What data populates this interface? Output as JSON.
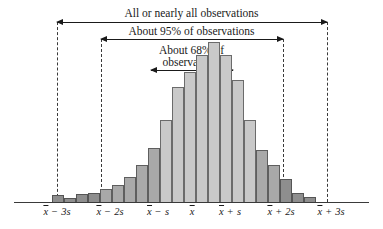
{
  "annotations": {
    "all": "All or nearly all observations",
    "pct95": "About 95% of observations",
    "pct68_line1": "About 68% of",
    "pct68_line2": "observations"
  },
  "axis": {
    "ticks": [
      {
        "id": "minus-3s",
        "mean": "x",
        "op": "−",
        "sd": "3s",
        "x": 57
      },
      {
        "id": "minus-2s",
        "mean": "x",
        "op": "−",
        "sd": "2s",
        "x": 110
      },
      {
        "id": "minus-1s",
        "mean": "x",
        "op": "−",
        "sd": "s",
        "x": 158
      },
      {
        "id": "mean",
        "mean": "x",
        "op": "",
        "sd": "",
        "x": 192
      },
      {
        "id": "plus-1s",
        "mean": "x",
        "op": "+",
        "sd": "s",
        "x": 230
      },
      {
        "id": "plus-2s",
        "mean": "x",
        "op": "+",
        "sd": "2s",
        "x": 281
      },
      {
        "id": "plus-3s",
        "mean": "x",
        "op": "+",
        "sd": "3s",
        "x": 331
      }
    ]
  },
  "colors": {
    "dark": "#8e8e8e",
    "mid": "#a9a9a9",
    "light": "#c9c9c9",
    "ink": "#1a1a1a",
    "dash": "#3a3a3a"
  },
  "chart_data": {
    "type": "bar",
    "xlabel": "",
    "ylabel": "",
    "grid": false,
    "legend": null,
    "categories": [
      "b1",
      "b2",
      "b3",
      "b4",
      "b5",
      "b6",
      "b7",
      "b8",
      "b9",
      "b10",
      "b11",
      "b12",
      "b13",
      "b14",
      "b15",
      "b16",
      "b17",
      "b18",
      "b19",
      "b20",
      "b21",
      "b22"
    ],
    "values": [
      6,
      4,
      7,
      8,
      11,
      14,
      21,
      30,
      44,
      66,
      92,
      104,
      118,
      128,
      118,
      98,
      66,
      42,
      30,
      19,
      8,
      5
    ],
    "shades": [
      "dark",
      "dark",
      "dark",
      "dark",
      "mid",
      "mid",
      "mid",
      "mid",
      "mid",
      "light",
      "light",
      "light",
      "light",
      "light",
      "light",
      "light",
      "light",
      "mid",
      "mid",
      "dark",
      "dark",
      "dark"
    ],
    "bar_left": [
      52,
      64,
      76,
      88,
      100,
      112,
      124,
      136,
      148,
      160,
      172,
      184,
      196,
      208,
      220,
      232,
      244,
      256,
      268,
      280,
      292,
      304
    ],
    "bar_width": 12,
    "ylim": [
      0,
      140
    ],
    "annotations": [
      {
        "label": "All or nearly all observations",
        "from": "x-3s",
        "to": "x+3s"
      },
      {
        "label": "About 95% of observations",
        "from": "x-2s",
        "to": "x+2s"
      },
      {
        "label": "About 68% of observations",
        "from": "x-s",
        "to": "x+s"
      }
    ]
  },
  "guides": {
    "vlines": [
      {
        "id": "v-minus-3s",
        "x": 57,
        "top": 22,
        "bottom": 202
      },
      {
        "id": "v-minus-2s",
        "x": 101,
        "top": 39,
        "bottom": 202
      },
      {
        "id": "v-plus-2s",
        "x": 283,
        "top": 39,
        "bottom": 202
      },
      {
        "id": "v-plus-3s",
        "x": 327,
        "top": 22,
        "bottom": 202
      }
    ],
    "arrows": [
      {
        "id": "arrow-all",
        "left": 57,
        "right": 327,
        "y": 22
      },
      {
        "id": "arrow-95",
        "left": 101,
        "right": 283,
        "y": 39
      },
      {
        "id": "arrow-68",
        "left": 151,
        "right": 233,
        "y": 70
      }
    ]
  }
}
